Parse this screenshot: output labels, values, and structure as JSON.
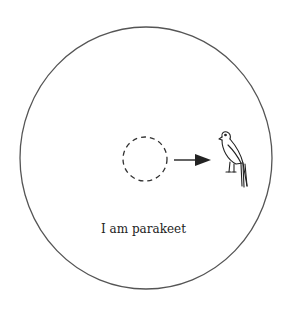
{
  "diagram": {
    "caption": "I am parakeet",
    "elements": {
      "outer_boundary": "solid circle",
      "placeholder": "dashed circle",
      "connector": "arrow pointing right",
      "figure": "parakeet-icon"
    },
    "colors": {
      "stroke": "#333333",
      "background": "#ffffff"
    }
  }
}
